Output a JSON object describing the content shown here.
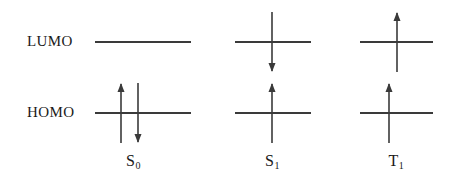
{
  "diagram": {
    "stroke_color": "#3a3a3a",
    "text_color": "#1a1a1a",
    "background": "#ffffff",
    "energy_levels": [
      {
        "name": "LUMO",
        "label": "LUMO",
        "y": 42
      },
      {
        "name": "HOMO",
        "label": "HOMO",
        "y": 113
      }
    ],
    "states": [
      {
        "id": "s0",
        "label_main": "S",
        "label_sub": "0",
        "label_text": "S0",
        "center_x": 133,
        "lumo_line": {
          "x": 95,
          "width": 96,
          "visible": true
        },
        "homo_line": {
          "x": 95,
          "width": 96,
          "visible": true
        },
        "electrons": [
          {
            "level": "HOMO",
            "spin": "up",
            "x": 121
          },
          {
            "level": "HOMO",
            "spin": "down",
            "x": 138
          }
        ]
      },
      {
        "id": "s1",
        "label_main": "S",
        "label_sub": "1",
        "label_text": "S1",
        "center_x": 272,
        "lumo_line": {
          "x": 235,
          "width": 76,
          "visible": true
        },
        "homo_line": {
          "x": 235,
          "width": 76,
          "visible": true
        },
        "electrons": [
          {
            "level": "LUMO",
            "spin": "down",
            "x": 272
          },
          {
            "level": "HOMO",
            "spin": "up",
            "x": 272
          }
        ]
      },
      {
        "id": "t1",
        "label_main": "T",
        "label_sub": "1",
        "label_text": "T1",
        "center_x": 396,
        "lumo_line": {
          "x": 360,
          "width": 73,
          "visible": true
        },
        "homo_line": {
          "x": 360,
          "width": 73,
          "visible": true
        },
        "electrons": [
          {
            "level": "LUMO",
            "spin": "up",
            "x": 397
          },
          {
            "level": "HOMO",
            "spin": "up",
            "x": 389
          }
        ]
      }
    ],
    "arrow": {
      "length": 60,
      "head_width": 7,
      "head_length": 9,
      "shaft_width": 1.6
    },
    "state_label_y": 152
  }
}
